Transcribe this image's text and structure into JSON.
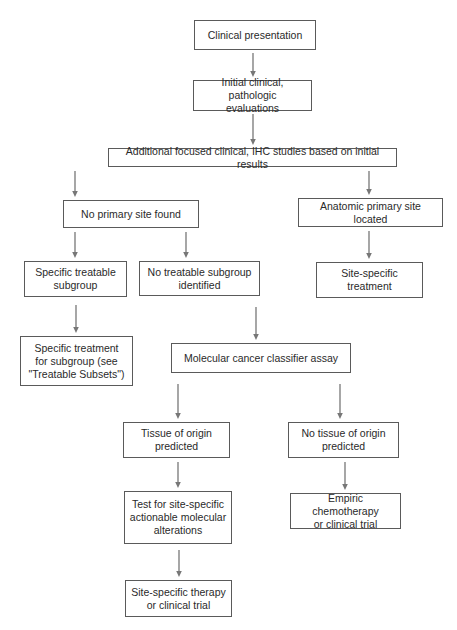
{
  "diagram": {
    "type": "flowchart",
    "nodes": [
      {
        "id": "n1",
        "label": "Clinical presentation",
        "box": [
          194,
          20,
          122,
          30
        ]
      },
      {
        "id": "n2",
        "label": "Initial clinical, pathologic\nevaluations",
        "box": [
          193,
          80,
          119,
          31
        ]
      },
      {
        "id": "n3",
        "label": "Additional focused clinical, IHC studies based on initial results",
        "box": [
          108,
          148,
          289,
          19
        ]
      },
      {
        "id": "n4",
        "label": "No primary site found",
        "box": [
          63,
          200,
          136,
          28
        ]
      },
      {
        "id": "n5",
        "label": "Anatomic primary site located",
        "box": [
          298,
          198,
          145,
          29
        ]
      },
      {
        "id": "n6",
        "label": "Specific treatable\nsubgroup",
        "box": [
          24,
          261,
          103,
          36
        ]
      },
      {
        "id": "n7",
        "label": "No treatable subgroup\nidentified",
        "box": [
          139,
          261,
          121,
          35
        ]
      },
      {
        "id": "n8",
        "label": "Site-specific\ntreatment",
        "box": [
          316,
          262,
          107,
          36
        ]
      },
      {
        "id": "n9",
        "label": "Specific treatment\nfor subgroup (see\n\"Treatable Subsets\")",
        "box": [
          20,
          336,
          113,
          50
        ]
      },
      {
        "id": "n10",
        "label": "Molecular cancer classifier assay",
        "box": [
          171,
          343,
          180,
          30
        ]
      },
      {
        "id": "n11",
        "label": "Tissue of origin\npredicted",
        "box": [
          123,
          422,
          107,
          36
        ]
      },
      {
        "id": "n12",
        "label": "No tissue of origin\npredicted",
        "box": [
          288,
          422,
          111,
          36
        ]
      },
      {
        "id": "n13",
        "label": "Test for site-specific\nactionable molecular\nalterations",
        "box": [
          124,
          491,
          108,
          53
        ]
      },
      {
        "id": "n14",
        "label": "Empiric chemotherapy\nor clinical trial",
        "box": [
          290,
          493,
          111,
          36
        ]
      },
      {
        "id": "n15",
        "label": "Site-specific therapy\nor clinical trial",
        "box": [
          125,
          580,
          107,
          37
        ]
      }
    ],
    "edges": [
      {
        "from": "n1",
        "to": "n2",
        "line": [
          253,
          53,
          253,
          77
        ]
      },
      {
        "from": "n2",
        "to": "n3",
        "line": [
          253,
          114,
          253,
          145
        ]
      },
      {
        "from": "n3",
        "to": "n4",
        "line": [
          75,
          171,
          75,
          197
        ]
      },
      {
        "from": "n3",
        "to": "n5",
        "line": [
          369,
          171,
          369,
          195
        ]
      },
      {
        "from": "n4",
        "to": "n6",
        "line": [
          75,
          232,
          75,
          258
        ]
      },
      {
        "from": "n4",
        "to": "n7",
        "line": [
          186,
          232,
          186,
          258
        ]
      },
      {
        "from": "n5",
        "to": "n8",
        "line": [
          369,
          231,
          369,
          259
        ]
      },
      {
        "from": "n6",
        "to": "n9",
        "line": [
          76,
          305,
          76,
          333
        ]
      },
      {
        "from": "n7",
        "to": "n10",
        "line": [
          256,
          307,
          256,
          340
        ]
      },
      {
        "from": "n10",
        "to": "n11",
        "line": [
          178,
          384,
          178,
          419
        ]
      },
      {
        "from": "n10",
        "to": "n12",
        "line": [
          340,
          384,
          340,
          419
        ]
      },
      {
        "from": "n11",
        "to": "n13",
        "line": [
          178,
          462,
          178,
          488
        ]
      },
      {
        "from": "n12",
        "to": "n14",
        "line": [
          345,
          462,
          345,
          490
        ]
      },
      {
        "from": "n13",
        "to": "n15",
        "line": [
          179,
          550,
          179,
          577
        ]
      }
    ],
    "colors": {
      "box_border": "#5a5a5a",
      "arrow": "#777777",
      "text": "#2a2a2a",
      "background": "#ffffff"
    }
  }
}
